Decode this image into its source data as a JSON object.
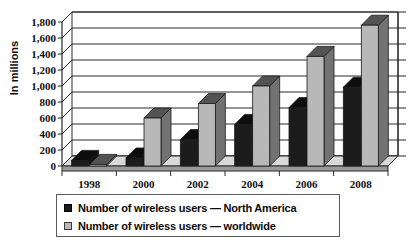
{
  "chart_data": {
    "type": "bar",
    "title": "",
    "xlabel": "",
    "ylabel": "In millions",
    "ylim": [
      0,
      1800
    ],
    "ytick_step": 200,
    "grid": true,
    "legend_position": "bottom",
    "style": "3d-clustered-column",
    "categories": [
      "1998",
      "2000",
      "2002",
      "2004",
      "2006",
      "2008"
    ],
    "series": [
      {
        "name": "Number of wireless users — North America",
        "color": "#1c1c1c",
        "values": [
          70,
          100,
          330,
          520,
          730,
          985
        ]
      },
      {
        "name": "Number of wireless users — worldwide",
        "color": "#b8b8b8",
        "values": [
          20,
          600,
          780,
          1000,
          1370,
          1760
        ]
      }
    ],
    "ytick_labels": [
      "1,800",
      "1,600",
      "1,400",
      "1,200",
      "1,000",
      "800",
      "600",
      "400",
      "200",
      "0"
    ],
    "ytick_values": [
      1800,
      1600,
      1400,
      1200,
      1000,
      800,
      600,
      400,
      200,
      0
    ]
  },
  "legend": {
    "items": [
      {
        "label": "Number of wireless users — North America",
        "swatch": "dark"
      },
      {
        "label": "Number of wireless users — worldwide",
        "swatch": "light"
      }
    ]
  },
  "colors": {
    "series_north_america": "#1c1c1c",
    "series_worldwide": "#b8b8b8",
    "axis": "#2b2b2b",
    "background": "#ffffff"
  }
}
